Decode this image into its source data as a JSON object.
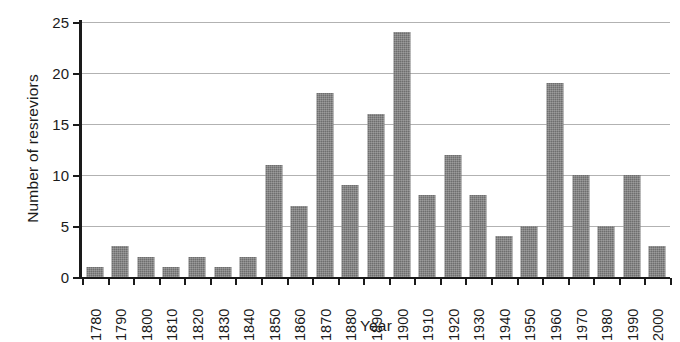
{
  "chart_data": {
    "type": "bar",
    "title": "",
    "xlabel": "Year",
    "ylabel": "Number of resreviors",
    "categories": [
      "1780",
      "1790",
      "1800",
      "1810",
      "1820",
      "1830",
      "1840",
      "1850",
      "1860",
      "1870",
      "1880",
      "1890",
      "1900",
      "1910",
      "1920",
      "1930",
      "1940",
      "1950",
      "1960",
      "1970",
      "1980",
      "1990",
      "2000"
    ],
    "values": [
      1,
      3,
      2,
      1,
      2,
      1,
      2,
      11,
      7,
      18,
      9,
      16,
      24,
      8,
      12,
      8,
      4,
      5,
      19,
      10,
      5,
      10,
      3
    ],
    "ylim": [
      0,
      25
    ],
    "ytick_labels": [
      "0",
      "5",
      "10",
      "15",
      "20",
      "25"
    ],
    "ytick_values": [
      0,
      5,
      10,
      15,
      20,
      25
    ],
    "grid": "horizontal",
    "legend": "none",
    "bar_color": "#6e6e6e",
    "axis_color": "#1a1a1a",
    "gridline_color": "#b2b2b2",
    "background_color": "#ffffff"
  }
}
